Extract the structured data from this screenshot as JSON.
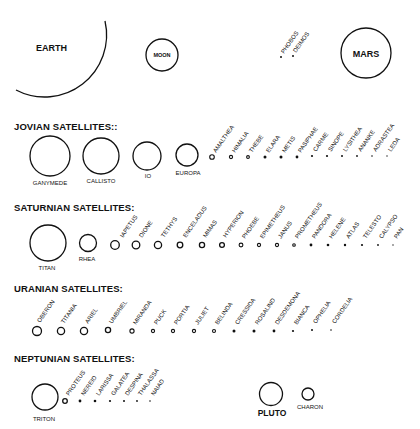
{
  "inner": {
    "earth": {
      "label": "EARTH"
    },
    "moon": {
      "label": "MOON"
    },
    "mars": {
      "label": "MARS"
    },
    "mars_moons": [
      {
        "name": "PHOBOS"
      },
      {
        "name": "DEIMOS"
      }
    ]
  },
  "jovian": {
    "heading": "JOVIAN SATELLITES::",
    "large": [
      {
        "name": "GANYMEDE"
      },
      {
        "name": "CALLISTO"
      },
      {
        "name": "IO"
      },
      {
        "name": "EUROPA"
      }
    ],
    "small": [
      {
        "name": "AMALTHEA"
      },
      {
        "name": "HIMALIA"
      },
      {
        "name": "THEBE"
      },
      {
        "name": "ELARA"
      },
      {
        "name": "METIS"
      },
      {
        "name": "PASIPHAE"
      },
      {
        "name": "CARME"
      },
      {
        "name": "SINOPE"
      },
      {
        "name": "LYSITHEA"
      },
      {
        "name": "ANANKE"
      },
      {
        "name": "ADRASTEA"
      },
      {
        "name": "LEDA"
      }
    ]
  },
  "saturnian": {
    "heading": "SATURNIAN SATELLITES:",
    "large": [
      {
        "name": "TITAN"
      },
      {
        "name": "RHEA"
      }
    ],
    "small": [
      {
        "name": "IAPETUS"
      },
      {
        "name": "DIONE"
      },
      {
        "name": "TETHYS"
      },
      {
        "name": "ENCELADUS"
      },
      {
        "name": "MIMAS"
      },
      {
        "name": "HYPERION"
      },
      {
        "name": "PHOEBE"
      },
      {
        "name": "EPIMETHEUS"
      },
      {
        "name": "JANUS"
      },
      {
        "name": "PROMETHEUS"
      },
      {
        "name": "PANDORA"
      },
      {
        "name": "HELENE"
      },
      {
        "name": "ATLAS"
      },
      {
        "name": "TELESTO"
      },
      {
        "name": "CALYPSO"
      },
      {
        "name": "PAN"
      }
    ]
  },
  "uranian": {
    "heading": "URANIAN SATELLITES:",
    "small": [
      {
        "name": "OBERON"
      },
      {
        "name": "TITANIA"
      },
      {
        "name": "ARIEL"
      },
      {
        "name": "UMBRIEL"
      },
      {
        "name": "MIRANDA"
      },
      {
        "name": "PUCK"
      },
      {
        "name": "PORTIA"
      },
      {
        "name": "JULIET"
      },
      {
        "name": "BELINDA"
      },
      {
        "name": "CRESSIDA"
      },
      {
        "name": "ROSALIND"
      },
      {
        "name": "DESDEMONA"
      },
      {
        "name": "BIANCA"
      },
      {
        "name": "OPHELIA"
      },
      {
        "name": "CORDELIA"
      }
    ]
  },
  "neptunian": {
    "heading": "NEPTUNIAN SATELLITES:",
    "large": [
      {
        "name": "TRITON"
      }
    ],
    "small": [
      {
        "name": "PROTEUS"
      },
      {
        "name": "NEREID"
      },
      {
        "name": "LARISSA"
      },
      {
        "name": "GALATEA"
      },
      {
        "name": "DESPINA"
      },
      {
        "name": "THALASSA"
      },
      {
        "name": "NAIAD"
      }
    ]
  },
  "pluto_system": {
    "pluto": {
      "label": "PLUTO"
    },
    "charon": {
      "label": "CHARON"
    }
  },
  "colors": {
    "ink": "#111111",
    "background": "#ffffff"
  }
}
